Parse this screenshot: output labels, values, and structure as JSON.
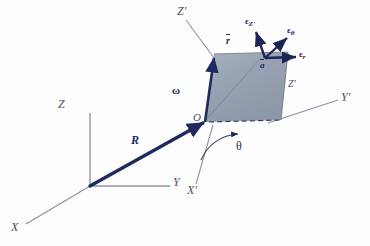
{
  "figure": {
    "type": "vector-diagram",
    "colors": {
      "plane_fill": "#9aa4b4",
      "plane_edge": "#2b3666",
      "vector": "#1f2a5e",
      "axis": "#8d93a3",
      "label": "#35405e",
      "background": "#fdfdfd"
    }
  },
  "axes": {
    "inertial": [
      {
        "name": "Z",
        "label": "Z",
        "x": 62,
        "y": 104
      },
      {
        "name": "Y",
        "label": "Y",
        "x": 176,
        "y": 182
      },
      {
        "name": "X",
        "label": "X",
        "x": 14,
        "y": 228
      }
    ],
    "primed": [
      {
        "name": "Z-prime",
        "label": "Z'",
        "x": 183,
        "y": 10
      },
      {
        "name": "Y-prime",
        "label": "Y'",
        "x": 342,
        "y": 97
      },
      {
        "name": "X-prime",
        "label": "X'",
        "x": 192,
        "y": 190
      }
    ]
  },
  "points": {
    "origin_inertial": {
      "x": 90,
      "y": 186
    },
    "origin_primed": {
      "label": "O",
      "x": 205,
      "y": 120
    },
    "field_point": {
      "label": "a",
      "overbar": true,
      "x": 263,
      "y": 62
    }
  },
  "vectors": {
    "position": {
      "name": "R",
      "label": "R",
      "label_x": 133,
      "label_y": 143
    },
    "angular_velocity": {
      "name": "omega",
      "label": "ω",
      "label_x": 175,
      "label_y": 92
    },
    "radius": {
      "name": "r-bar",
      "label": "r",
      "overbar": true,
      "label_x": 228,
      "label_y": 43
    }
  },
  "unit_vectors": [
    {
      "name": "epsilon-Z-prime",
      "base": "ε",
      "sub": "Z'",
      "x": 253,
      "y": 24
    },
    {
      "name": "epsilon-theta",
      "base": "ε",
      "sub": "θ",
      "x": 292,
      "y": 33
    },
    {
      "name": "epsilon-r",
      "base": "ε",
      "sub": "r",
      "x": 303,
      "y": 57
    }
  ],
  "angle": {
    "name": "theta",
    "label": "θ",
    "x": 238,
    "y": 148
  },
  "plane_labels": [
    {
      "name": "plane-edge-z-prime",
      "label": "Z'",
      "x": 290,
      "y": 85
    }
  ],
  "plane": {
    "name": "rotating-plane",
    "corners": [
      {
        "x": 205,
        "y": 122
      },
      {
        "x": 214,
        "y": 54
      },
      {
        "x": 288,
        "y": 52
      },
      {
        "x": 281,
        "y": 120
      }
    ]
  }
}
